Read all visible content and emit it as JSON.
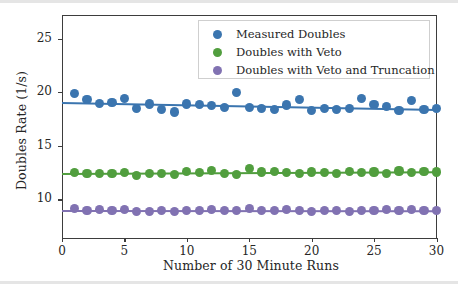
{
  "chart_data": {
    "type": "scatter",
    "title": "",
    "xlabel": "Number of 30 Minute Runs",
    "ylabel": "Doubles Rate (1/s)",
    "xlim": [
      0,
      30
    ],
    "ylim": [
      6.4,
      27.2
    ],
    "xticks": [
      0,
      5,
      10,
      15,
      20,
      25,
      30
    ],
    "yticks": [
      10,
      15,
      20,
      25
    ],
    "grid": false,
    "legend_position": "upper right",
    "x": [
      1,
      2,
      3,
      4,
      5,
      6,
      7,
      8,
      9,
      10,
      11,
      12,
      13,
      14,
      15,
      16,
      17,
      18,
      19,
      20,
      21,
      22,
      23,
      24,
      25,
      26,
      27,
      28,
      29,
      30
    ],
    "series": [
      {
        "name": "Measured Doubles",
        "color": "#3b75af",
        "values": [
          19.85,
          19.3,
          18.95,
          19.05,
          19.4,
          18.45,
          18.9,
          18.35,
          18.15,
          18.9,
          18.85,
          18.75,
          18.6,
          19.95,
          18.6,
          18.45,
          18.4,
          18.8,
          19.35,
          18.3,
          18.5,
          18.35,
          18.45,
          19.4,
          18.85,
          18.65,
          18.3,
          19.25,
          18.35,
          18.5
        ],
        "fit": {
          "intercept": 19.08,
          "slope": -0.0215
        }
      },
      {
        "name": "Doubles with Veto",
        "color": "#519e3e",
        "values": [
          12.5,
          12.4,
          12.45,
          12.4,
          12.5,
          12.2,
          12.4,
          12.45,
          12.35,
          12.6,
          12.5,
          12.7,
          12.4,
          12.35,
          12.9,
          12.55,
          12.6,
          12.5,
          12.45,
          12.55,
          12.5,
          12.45,
          12.6,
          12.5,
          12.55,
          12.45,
          12.65,
          12.5,
          12.6,
          12.55
        ]
      },
      {
        "name": "Doubles with Veto and Truncation",
        "color": "#8172b2",
        "values": [
          9.15,
          9.0,
          9.05,
          9.0,
          9.05,
          8.9,
          8.85,
          9.0,
          8.85,
          9.0,
          9.0,
          9.05,
          8.95,
          9.0,
          9.15,
          9.0,
          8.95,
          9.05,
          9.0,
          8.9,
          9.0,
          9.0,
          8.85,
          9.0,
          8.95,
          9.05,
          9.0,
          9.05,
          9.0,
          8.95
        ]
      }
    ]
  },
  "legend": {
    "entries": [
      {
        "label": "Measured Doubles"
      },
      {
        "label": "Doubles with Veto"
      },
      {
        "label": "Doubles with Veto and Truncation"
      }
    ]
  }
}
